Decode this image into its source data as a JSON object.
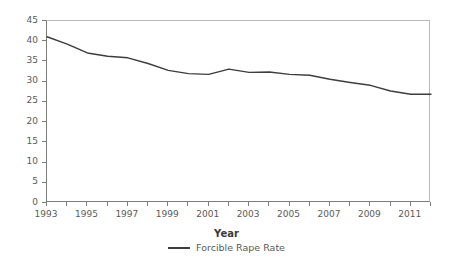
{
  "chart_data": {
    "type": "line",
    "title": "",
    "xlabel": "Year",
    "ylabel": "",
    "xlim": [
      1993,
      2012
    ],
    "ylim": [
      0,
      45
    ],
    "ytick_step": 5,
    "grid": false,
    "legend_position": "bottom-center",
    "line_color": "#3d3d3d",
    "axis_color": "#7d7d7d",
    "frame_color": "#b9b9b9",
    "text_color": "#5a5a5a",
    "x": [
      1993,
      1994,
      1995,
      1996,
      1997,
      1998,
      1999,
      2000,
      2001,
      2002,
      2003,
      2004,
      2005,
      2006,
      2007,
      2008,
      2009,
      2010,
      2011,
      2012
    ],
    "y_ticks": [
      0,
      5,
      10,
      15,
      20,
      25,
      30,
      35,
      40,
      45
    ],
    "y_tick_labels": [
      "0",
      "5",
      "10",
      "15",
      "20",
      "25",
      "30",
      "35",
      "40",
      "45"
    ],
    "x_major_ticks": [
      1993,
      1995,
      1997,
      1999,
      2001,
      2003,
      2005,
      2007,
      2009,
      2011
    ],
    "x_major_tick_labels": [
      "1993",
      "1995",
      "1997",
      "1999",
      "2001",
      "2003",
      "2005",
      "2007",
      "2009",
      "2011"
    ],
    "x_minor_ticks": [
      1994,
      1996,
      1998,
      2000,
      2002,
      2004,
      2006,
      2008,
      2010,
      2012
    ],
    "series": [
      {
        "name": "Forcible Rape Rate",
        "values": [
          41.1,
          39.3,
          37.1,
          36.3,
          35.9,
          34.5,
          32.8,
          32.0,
          31.8,
          33.1,
          32.3,
          32.4,
          31.8,
          31.6,
          30.6,
          29.8,
          29.1,
          27.7,
          26.9,
          26.9
        ]
      }
    ]
  },
  "axis": {
    "x_title": "Year"
  },
  "legend": {
    "entries": [
      {
        "label": "Forcible Rape Rate",
        "color": "#3d3d3d",
        "marker": "line"
      }
    ]
  }
}
